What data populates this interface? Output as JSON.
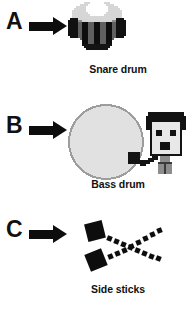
{
  "figure": {
    "background_color": "#ffffff",
    "width": 192,
    "height": 310,
    "style": "pixel-art instrument diagram with labelled panels"
  },
  "panels": [
    {
      "letter": "A",
      "caption": "Snare drum",
      "arrow_icon": "right-arrow-icon",
      "art_icon": "snare-drum-icon",
      "colors": {
        "head": "#d9d9d9",
        "head_highlight": "#ffffff",
        "shell": "#5e5e5e",
        "lug": "#101010",
        "rim": "#9a9a9a"
      }
    },
    {
      "letter": "B",
      "caption": "Bass drum",
      "arrow_icon": "right-arrow-icon",
      "art_icon": "bass-drum-icon",
      "colors": {
        "head": "#e0e0e0",
        "outline": "#9d9d9d",
        "player_hair": "#121212",
        "player_face": "#e6e6e6",
        "player_outline": "#141414"
      }
    },
    {
      "letter": "C",
      "caption": "Side sticks",
      "arrow_icon": "right-arrow-icon",
      "art_icon": "side-sticks-icon",
      "colors": {
        "stick": "#0d0d0d",
        "stick_head": "#0d0d0d"
      }
    }
  ],
  "arrow": {
    "label": "points-to",
    "color": "#0d0d0d"
  }
}
